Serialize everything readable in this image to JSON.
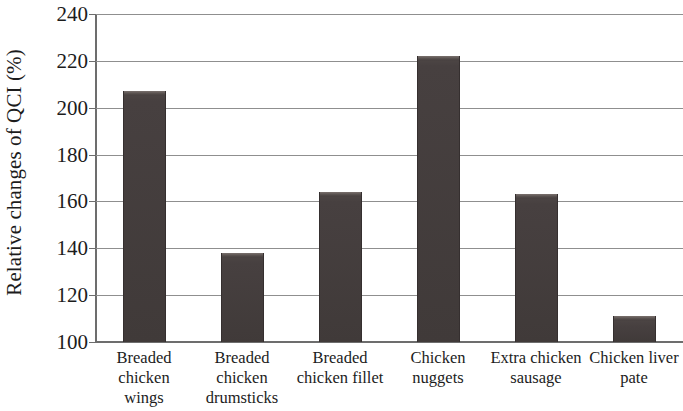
{
  "chart_data": {
    "type": "bar",
    "title": "",
    "xlabel": "",
    "ylabel": "Relative changes of QCI (%)",
    "categories": [
      "Breaded chicken wings",
      "Breaded chicken drumsticks",
      "Breaded chicken fillet",
      "Chicken nuggets",
      "Extra chicken sausage",
      "Chicken liver pate"
    ],
    "category_lines": [
      [
        "Breaded",
        "chicken",
        "wings"
      ],
      [
        "Breaded",
        "chicken",
        "drumsticks"
      ],
      [
        "Breaded",
        "chicken fillet"
      ],
      [
        "Chicken",
        "nuggets"
      ],
      [
        "Extra chicken",
        "sausage"
      ],
      [
        "Chicken liver",
        "pate"
      ]
    ],
    "values": [
      207,
      138,
      164,
      222,
      163,
      111
    ],
    "ylim": [
      100,
      240
    ],
    "ytick_labels": [
      "240",
      "220",
      "200",
      "180",
      "160",
      "140",
      "120",
      "100"
    ],
    "ytick_values": [
      240,
      220,
      200,
      180,
      160,
      140,
      120,
      100
    ],
    "grid": true,
    "legend": "none",
    "bar_color": "#474040",
    "grid_color": "#8f8f8f",
    "axis_color": "#6d6d6d",
    "text_color": "#1c1c1c"
  }
}
